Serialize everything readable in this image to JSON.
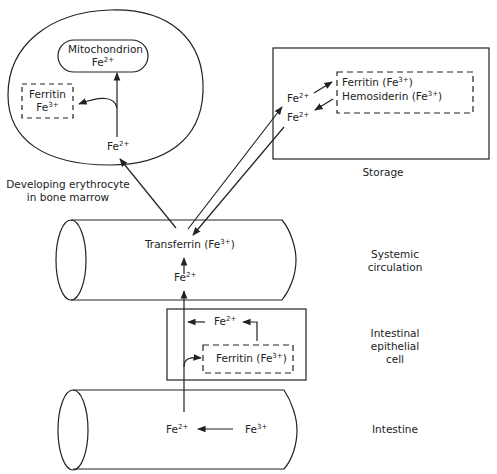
{
  "diagram": {
    "nodes": {
      "erythrocyte": {
        "label_line1": "Developing erythrocyte",
        "label_line2": "in bone marrow",
        "mitochondrion": {
          "name": "Mitochondrion",
          "ion": "Fe",
          "charge": "2+"
        },
        "ferritin": {
          "name": "Ferritin",
          "ion": "Fe",
          "charge": "3+"
        },
        "entry_ion": {
          "ion": "Fe",
          "charge": "2+"
        }
      },
      "storage": {
        "label": "Storage",
        "ion_in": {
          "ion": "Fe",
          "charge": "2+"
        },
        "ion_out": {
          "ion": "Fe",
          "charge": "2+"
        },
        "ferritin": {
          "name": "Ferritin (Fe",
          "charge": "3+",
          "close": ")"
        },
        "hemosiderin": {
          "name": "Hemosiderin (Fe",
          "charge": "3+",
          "close": ")"
        }
      },
      "systemic": {
        "label_line1": "Systemic",
        "label_line2": "circulation",
        "transferrin": {
          "name": "Transferrin (Fe",
          "charge": "3+",
          "close": ")"
        },
        "ion": {
          "ion": "Fe",
          "charge": "2+"
        }
      },
      "epithelial": {
        "label_line1": "Intestinal",
        "label_line2": "epithelial",
        "label_line3": "cell",
        "ion": {
          "ion": "Fe",
          "charge": "2+"
        },
        "ferritin": {
          "name": "Ferritin (Fe",
          "charge": "3+",
          "close": ")"
        }
      },
      "intestine": {
        "label": "Intestine",
        "ion_reduced": {
          "ion": "Fe",
          "charge": "2+"
        },
        "ion_dietary": {
          "ion": "Fe",
          "charge": "3+"
        }
      }
    },
    "colors": {
      "stroke": "#222222",
      "background": "#ffffff"
    }
  }
}
